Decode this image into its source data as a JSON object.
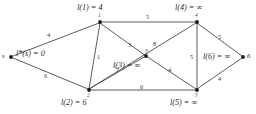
{
  "diagram": {
    "edge_color": "#4a4a4a",
    "node_color": "#1a1a1a",
    "text_color": "#2b2b2b",
    "background": "#ffffff"
  },
  "nodes": [
    {
      "id": "s",
      "name": "s",
      "label": "l*(s) = 0",
      "num": "",
      "x": 11,
      "y": 57
    },
    {
      "id": "1",
      "name": "1",
      "label": "l(1) = 4",
      "num": "1",
      "x": 100,
      "y": 22
    },
    {
      "id": "2",
      "name": "2",
      "label": "l(2) = 6",
      "num": "2",
      "x": 89,
      "y": 90
    },
    {
      "id": "3",
      "name": "3",
      "label": "l(3) = ∞",
      "num": "3",
      "x": 146,
      "y": 56
    },
    {
      "id": "4",
      "name": "4",
      "label": "l(4) = ∞",
      "num": "4",
      "x": 197,
      "y": 22
    },
    {
      "id": "5",
      "name": "5",
      "label": "l(5) = ∞",
      "num": "5",
      "x": 197,
      "y": 90
    },
    {
      "id": "6",
      "name": "6",
      "label": "l(6) = ∞",
      "num": "",
      "x": 243,
      "y": 57
    }
  ],
  "edges": [
    {
      "from": "s",
      "to": "1",
      "weight": "4"
    },
    {
      "from": "s",
      "to": "2",
      "weight": "6"
    },
    {
      "from": "1",
      "to": "2",
      "weight": "1"
    },
    {
      "from": "1",
      "to": "3",
      "weight": "3"
    },
    {
      "from": "1",
      "to": "4",
      "weight": "5"
    },
    {
      "from": "2",
      "to": "4",
      "weight": "8"
    },
    {
      "from": "2",
      "to": "3",
      "weight": "7"
    },
    {
      "from": "2",
      "to": "5",
      "weight": "6"
    },
    {
      "from": "3",
      "to": "5",
      "weight": "4"
    },
    {
      "from": "4",
      "to": "5",
      "weight": "5"
    },
    {
      "from": "4",
      "to": "6",
      "weight": "5"
    },
    {
      "from": "5",
      "to": "6",
      "weight": "4"
    }
  ],
  "labels": {
    "node_s": "s",
    "node_6": "6",
    "l_s": "l*(s) = 0",
    "l_1": "l(1) = 4",
    "l_2": "l(2) = 6",
    "l_3": "l(3) = ∞",
    "l_4": "l(4) = ∞",
    "l_5": "l(5) = ∞",
    "l_6": "l(6) = ∞",
    "n1": "1",
    "n2": "2",
    "n3": "3",
    "n4": "4",
    "n5": "5"
  },
  "weights": {
    "s_1": "4",
    "s_2": "6",
    "e1_2": "1",
    "e1_3": "3",
    "e1_4": "5",
    "e2_4": "8",
    "e2_3": "7",
    "e2_5": "6",
    "e3_5": "4",
    "e4_5": "5",
    "e4_6": "5",
    "e5_6": "4"
  }
}
